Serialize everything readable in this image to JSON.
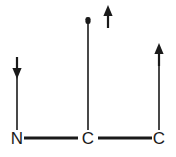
{
  "figure": {
    "background_color": "#ffffff",
    "stroke_color": "#1a1a1a",
    "width": 176,
    "height": 157
  },
  "atoms": [
    {
      "id": "atom-n",
      "label": "N",
      "x": 17,
      "y": 144
    },
    {
      "id": "atom-c1",
      "label": "C",
      "x": 88,
      "y": 144
    },
    {
      "id": "atom-c2",
      "label": "C",
      "x": 159,
      "y": 144
    }
  ],
  "bonds": [
    {
      "id": "bond-n-c1",
      "kind": "horizontal",
      "x1": 24,
      "y1": 138,
      "x2": 78,
      "y2": 138
    },
    {
      "id": "bond-c1-c2",
      "kind": "horizontal",
      "x1": 98,
      "y1": 138,
      "x2": 152,
      "y2": 138
    },
    {
      "id": "bond-n-vertical",
      "kind": "vertical",
      "x1": 17,
      "y1": 62,
      "x2": 17,
      "y2": 130
    },
    {
      "id": "bond-c1-vertical",
      "kind": "vertical",
      "x1": 88,
      "y1": 19,
      "x2": 88,
      "y2": 130
    },
    {
      "id": "bond-c2-vertical",
      "kind": "vertical",
      "x1": 159,
      "y1": 48,
      "x2": 159,
      "y2": 130
    }
  ],
  "arrows": [
    {
      "id": "arrow-down-on-n",
      "direction": "down",
      "icon": "arrow-down-icon",
      "x": 17,
      "top": 57,
      "bottom": 78,
      "attached_to": "N"
    },
    {
      "id": "arrow-up-floating",
      "direction": "up",
      "icon": "arrow-up-icon",
      "x": 108,
      "top": 6,
      "bottom": 28,
      "attached_to": "none"
    },
    {
      "id": "arrow-up-on-c2",
      "direction": "up",
      "icon": "arrow-up-icon",
      "x": 159,
      "top": 44,
      "bottom": 66,
      "attached_to": "C"
    }
  ],
  "center_stem": {
    "id": "center-stem-cap",
    "description": "blunt rounded cap at top of central vertical bond",
    "x": 88,
    "y": 19
  }
}
